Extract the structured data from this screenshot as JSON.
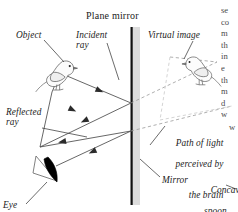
{
  "figure": {
    "title": "Plane mirror",
    "width": 238,
    "height": 212,
    "colors": {
      "ink": "#1b1b1b",
      "mirror_line": "#111111",
      "mirror_band": "#dcdcdc",
      "ray": "#4b4b4b",
      "virtual_ray": "#8a8a8a",
      "bird_outline": "#555555",
      "eye_fill": "#000000",
      "body_text": "#4a4a4a",
      "background": "#ffffff"
    }
  },
  "labels": {
    "object": "Object",
    "incident_ray": "Incident\nray",
    "virtual_image": "Virtual image",
    "reflected_ray": "Reflected\nray",
    "path_of_light_1": "Path of light",
    "path_of_light_2": "perceived by",
    "path_of_light_3": "the brain",
    "mirror": "Mirror",
    "concave_1": "Concave",
    "concave_2": "spoon",
    "eye": "Eye"
  },
  "icons": {
    "object_bird": "bird-icon",
    "virtual_bird": "bird-icon",
    "eye": "eye-icon",
    "mirror_surface": "mirror-line-icon",
    "incident_arrow": "arrowhead-icon",
    "reflected_arrow": "arrowhead-icon"
  },
  "body_text_column": {
    "lines": [
      "se",
      "co",
      "m",
      "th",
      "in",
      "e",
      "th",
      "m",
      "d",
      "w"
    ],
    "tail": "w"
  },
  "diagram_data": {
    "type": "ray-diagram",
    "mirror": {
      "x": 131,
      "y_top": 28,
      "y_bottom": 205,
      "orientation": "vertical"
    },
    "object_position": {
      "x": 52,
      "y": 82
    },
    "virtual_image_position": {
      "x": 192,
      "y": 78
    },
    "eye_position": {
      "x": 47,
      "y": 172
    },
    "reflection_points": [
      {
        "x": 131,
        "y": 103
      },
      {
        "x": 131,
        "y": 131
      }
    ],
    "rays": [
      {
        "name": "incident-ray-upper",
        "style": "solid",
        "from": [
          60,
          74
        ],
        "to": [
          131,
          103
        ],
        "arrow_at": 0.5
      },
      {
        "name": "reflected-ray-upper",
        "style": "solid",
        "from": [
          131,
          103
        ],
        "to": [
          41,
          148
        ],
        "arrow_at": 0.55
      },
      {
        "name": "incident-ray-lower",
        "style": "solid",
        "from": [
          41,
          148
        ],
        "to": [
          131,
          131
        ],
        "arrow_at": 0.0
      },
      {
        "name": "reflected-ray-lower",
        "style": "solid",
        "from": [
          131,
          131
        ],
        "to": [
          55,
          166
        ],
        "arrow_at": 0.6
      },
      {
        "name": "virtual-ray-upper",
        "style": "dashed",
        "from": [
          131,
          103
        ],
        "to": [
          215,
          62
        ]
      },
      {
        "name": "virtual-ray-lower",
        "style": "dashed",
        "from": [
          131,
          131
        ],
        "to": [
          226,
          108
        ]
      }
    ],
    "leader_lines": [
      {
        "name": "leader-object",
        "from": [
          40,
          40
        ],
        "to": [
          62,
          62
        ]
      },
      {
        "name": "leader-incident",
        "from": [
          105,
          42
        ],
        "to": [
          120,
          82
        ]
      },
      {
        "name": "leader-virtual",
        "from": [
          190,
          41
        ],
        "to": [
          182,
          60
        ]
      },
      {
        "name": "leader-reflected",
        "from": [
          40,
          128
        ],
        "to": [
          86,
          136
        ]
      },
      {
        "name": "leader-path",
        "from": [
          164,
          126
        ],
        "to": [
          150,
          146
        ]
      },
      {
        "name": "leader-mirror",
        "from": [
          160,
          176
        ],
        "to": [
          140,
          160
        ]
      },
      {
        "name": "leader-concave",
        "from": [
          234,
          188
        ],
        "to": [
          224,
          184
        ]
      },
      {
        "name": "leader-eye",
        "from": [
          26,
          199
        ],
        "to": [
          46,
          179
        ]
      }
    ]
  }
}
